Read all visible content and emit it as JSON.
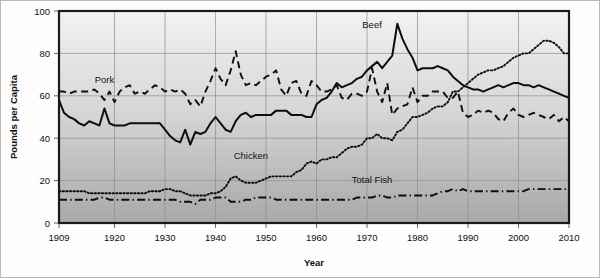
{
  "chart_data": {
    "type": "line",
    "title": "",
    "xlabel": "Year",
    "ylabel": "Pounds per Capita",
    "xlim": [
      1909,
      2010
    ],
    "ylim": [
      0,
      100
    ],
    "grid": true,
    "legend": "inline-annotations",
    "xticks": [
      "1909",
      "1920",
      "1930",
      "1940",
      "1950",
      "1960",
      "1970",
      "1980",
      "1990",
      "2000",
      "2010"
    ],
    "xtick_values": [
      1909,
      1920,
      1930,
      1940,
      1950,
      1960,
      1970,
      1980,
      1990,
      2000,
      2010
    ],
    "yticks": [
      "0",
      "20",
      "40",
      "60",
      "80",
      "100"
    ],
    "ytick_values": [
      0,
      20,
      40,
      60,
      80,
      100
    ],
    "annotations": [
      {
        "text": "Pork",
        "x": 1918,
        "y": 66
      },
      {
        "text": "Beef",
        "x": 1971,
        "y": 92
      },
      {
        "text": "Chicken",
        "x": 1947,
        "y": 30
      },
      {
        "text": "Total Fish",
        "x": 1971,
        "y": 19
      }
    ],
    "x": [
      1909,
      1910,
      1911,
      1912,
      1913,
      1914,
      1915,
      1916,
      1917,
      1918,
      1919,
      1920,
      1921,
      1922,
      1923,
      1924,
      1925,
      1926,
      1927,
      1928,
      1929,
      1930,
      1931,
      1932,
      1933,
      1934,
      1935,
      1936,
      1937,
      1938,
      1939,
      1940,
      1941,
      1942,
      1943,
      1944,
      1945,
      1946,
      1947,
      1948,
      1949,
      1950,
      1951,
      1952,
      1953,
      1954,
      1955,
      1956,
      1957,
      1958,
      1959,
      1960,
      1961,
      1962,
      1963,
      1964,
      1965,
      1966,
      1967,
      1968,
      1969,
      1970,
      1971,
      1972,
      1973,
      1974,
      1975,
      1976,
      1977,
      1978,
      1979,
      1980,
      1981,
      1982,
      1983,
      1984,
      1985,
      1986,
      1987,
      1988,
      1989,
      1990,
      1991,
      1992,
      1993,
      1994,
      1995,
      1996,
      1997,
      1998,
      1999,
      2000,
      2001,
      2002,
      2003,
      2004,
      2005,
      2006,
      2007,
      2008,
      2009,
      2010
    ],
    "series": [
      {
        "name": "Beef",
        "style": "solid",
        "values": [
          58,
          52,
          50,
          49,
          47,
          46,
          48,
          47,
          46,
          54,
          47,
          46,
          46,
          46,
          47,
          47,
          47,
          47,
          47,
          47,
          47,
          44,
          41,
          39,
          38,
          44,
          37,
          43,
          42,
          43,
          47,
          50,
          47,
          44,
          43,
          48,
          51,
          52,
          50,
          51,
          51,
          51,
          51,
          53,
          53,
          53,
          51,
          51,
          51,
          50,
          50,
          56,
          58,
          59,
          62,
          66,
          64,
          65,
          66,
          68,
          69,
          72,
          74,
          76,
          73,
          76,
          79,
          94,
          87,
          82,
          78,
          72,
          73,
          73,
          73,
          74,
          73,
          72,
          69,
          67,
          65,
          64,
          63,
          63,
          62,
          63,
          64,
          65,
          64,
          65,
          66,
          66,
          65,
          65,
          64,
          65,
          64,
          63,
          62,
          61,
          60,
          59
        ]
      },
      {
        "name": "Pork",
        "style": "dashed",
        "values": [
          62,
          62,
          61,
          62,
          62,
          62,
          62,
          63,
          61,
          58,
          62,
          57,
          62,
          64,
          65,
          61,
          62,
          61,
          63,
          65,
          64,
          62,
          63,
          62,
          63,
          61,
          56,
          58,
          55,
          62,
          67,
          73,
          68,
          65,
          72,
          81,
          70,
          65,
          66,
          65,
          67,
          69,
          70,
          72,
          63,
          60,
          66,
          67,
          61,
          60,
          67,
          65,
          62,
          62,
          63,
          65,
          59,
          58,
          61,
          61,
          60,
          62,
          73,
          62,
          57,
          66,
          51,
          54,
          55,
          56,
          64,
          57,
          60,
          60,
          62,
          62,
          62,
          59,
          59,
          62,
          52,
          50,
          51,
          53,
          52,
          53,
          52,
          49,
          48,
          52,
          54,
          51,
          50,
          51,
          52,
          51,
          50,
          49,
          51,
          48,
          50,
          48
        ]
      },
      {
        "name": "Chicken",
        "style": "dotted",
        "values": [
          15,
          15,
          15,
          15,
          15,
          15,
          14,
          14,
          14,
          14,
          14,
          14,
          14,
          14,
          14,
          14,
          14,
          14,
          15,
          15,
          15,
          16,
          16,
          15,
          15,
          14,
          13,
          13,
          13,
          13,
          14,
          14,
          15,
          17,
          21,
          22,
          20,
          19,
          19,
          19,
          20,
          21,
          22,
          22,
          22,
          22,
          22,
          24,
          25,
          28,
          29,
          28,
          30,
          30,
          31,
          31,
          33,
          35,
          36,
          36,
          37,
          40,
          40,
          42,
          40,
          40,
          39,
          43,
          44,
          47,
          50,
          50,
          51,
          52,
          54,
          55,
          55,
          57,
          62,
          62,
          64,
          66,
          68,
          70,
          71,
          72,
          72,
          73,
          74,
          76,
          78,
          79,
          80,
          80,
          82,
          84,
          86,
          86,
          85,
          83,
          80,
          80
        ]
      },
      {
        "name": "Total Fish",
        "style": "dashdot",
        "values": [
          11,
          11,
          11,
          11,
          11,
          11,
          11,
          11,
          12,
          12,
          11,
          11,
          11,
          11,
          11,
          11,
          11,
          11,
          11,
          11,
          11,
          11,
          11,
          11,
          10,
          10,
          10,
          9,
          11,
          11,
          11,
          12,
          12,
          12,
          10,
          10,
          10,
          11,
          11,
          12,
          12,
          12,
          12,
          11,
          11,
          11,
          11,
          11,
          11,
          11,
          11,
          11,
          11,
          11,
          11,
          11,
          11,
          11,
          11,
          12,
          12,
          12,
          12,
          13,
          13,
          12,
          12,
          13,
          13,
          13,
          13,
          13,
          13,
          13,
          13,
          14,
          15,
          15,
          16,
          15,
          16,
          15,
          15,
          15,
          15,
          15,
          15,
          15,
          15,
          15,
          15,
          15,
          15,
          16,
          16,
          16,
          16,
          16,
          16,
          16,
          16,
          16
        ]
      }
    ]
  }
}
